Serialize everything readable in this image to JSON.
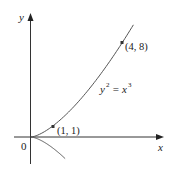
{
  "chart_data": {
    "type": "line",
    "title": "",
    "equation": "y^2 = x^3",
    "equation_label": {
      "lhs": "y",
      "lhs_exp": "2",
      "eq": "=",
      "rhs": "x",
      "rhs_exp": "3"
    },
    "xlabel": "x",
    "ylabel": "y",
    "origin_label": "0",
    "grid": false,
    "legend": null,
    "series": [
      {
        "name": "upper branch y = x^(3/2)",
        "x": [
          0,
          0.25,
          0.5,
          1,
          1.5,
          2,
          2.5,
          3,
          3.5,
          4,
          4.5
        ],
        "y": [
          0,
          0.125,
          0.354,
          1,
          1.837,
          2.828,
          3.953,
          5.196,
          6.548,
          8,
          9.546
        ]
      },
      {
        "name": "lower branch y = -x^(3/2)",
        "x": [
          0,
          0.25,
          0.5,
          1,
          1.5
        ],
        "y": [
          0,
          -0.125,
          -0.354,
          -1,
          -1.837
        ]
      }
    ],
    "points": [
      {
        "x": 1,
        "y": 1,
        "label": "(1, 1)"
      },
      {
        "x": 4,
        "y": 8,
        "label": "(4, 8)"
      }
    ],
    "xlim": [
      -1.2,
      5.8
    ],
    "ylim": [
      -2.2,
      10.5
    ]
  },
  "labels": {
    "y_axis": "y",
    "x_axis": "x",
    "origin": "0",
    "p1": "(1, 1)",
    "p2": "(4, 8)",
    "eq_lhs": "y",
    "eq_lhs_exp": "2",
    "eq_mid": " = ",
    "eq_rhs": "x",
    "eq_rhs_exp": "3"
  }
}
